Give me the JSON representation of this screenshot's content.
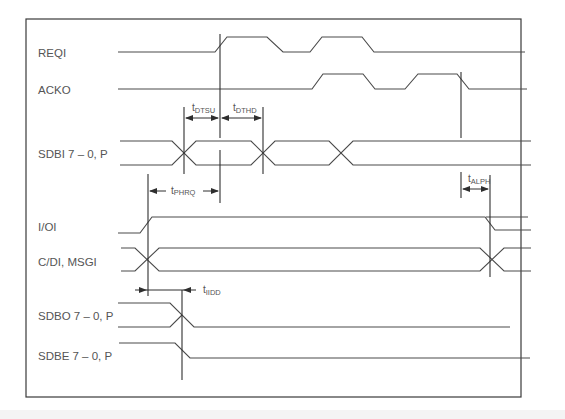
{
  "diagram": {
    "type": "timing-diagram",
    "signals": [
      {
        "id": "reqi",
        "label": "REQI"
      },
      {
        "id": "acko",
        "label": "ACKO"
      },
      {
        "id": "sdbi",
        "label": "SDBI 7 – 0, P"
      },
      {
        "id": "ioi",
        "label": "I/OI"
      },
      {
        "id": "cdi",
        "label": "C/DI, MSGI"
      },
      {
        "id": "sdbo",
        "label": "SDBO 7 – 0, P"
      },
      {
        "id": "sdbe",
        "label": "SDBE 7 – 0, P"
      }
    ],
    "timing_parameters": [
      {
        "id": "dtsu",
        "t": "t",
        "sub": "DTSU",
        "meaning": "data setup"
      },
      {
        "id": "dthd",
        "t": "t",
        "sub": "DTHD",
        "meaning": "data hold"
      },
      {
        "id": "phrq",
        "t": "t",
        "sub": "PHRQ"
      },
      {
        "id": "alph",
        "t": "t",
        "sub": "ALPH"
      },
      {
        "id": "iidd",
        "t": "t",
        "sub": "IIDD"
      }
    ],
    "colors": {
      "line": "#4a4a4a",
      "text": "#555555",
      "background": "#ffffff"
    }
  }
}
